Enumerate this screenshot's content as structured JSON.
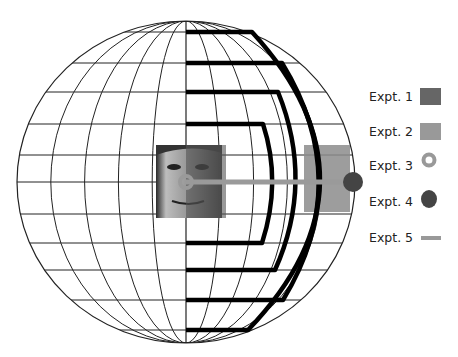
{
  "figure": {
    "globe": {
      "cx": 186,
      "cy": 182,
      "rx": 169,
      "ry": 161,
      "meridian_fractions": [
        0.2,
        0.4,
        0.6,
        0.8
      ],
      "latitudes": [
        32,
        63,
        92,
        124,
        155,
        182,
        214,
        243,
        270,
        300,
        330
      ],
      "line_color": "#222222"
    },
    "thick_paths": [
      {
        "name": "thick-path-1",
        "top_y": 124,
        "top_x": 263,
        "mid_x": 277,
        "bottom_y": 243,
        "bottom_x": 262
      },
      {
        "name": "thick-path-2",
        "top_y": 92,
        "top_x": 278,
        "mid_x": 305,
        "bottom_y": 270,
        "bottom_x": 275
      },
      {
        "name": "thick-path-3",
        "top_y": 63,
        "top_x": 282,
        "mid_x": 336,
        "bottom_y": 300,
        "bottom_x": 283
      },
      {
        "name": "thick-path-4",
        "top_y": 32,
        "top_x": 252,
        "mid_x": 354,
        "bottom_y": 330,
        "bottom_x": 248
      }
    ],
    "face": {
      "x": 156,
      "y": 145,
      "w": 66,
      "h": 73
    },
    "expt1_box": {
      "x": 186,
      "y": 145,
      "w": 40,
      "h": 73,
      "color": "#555555"
    },
    "expt2_box": {
      "x": 304,
      "y": 145,
      "w": 46,
      "h": 67,
      "color": "#8c8c8c"
    },
    "expt3_ring": {
      "cx": 186,
      "cy": 182,
      "r": 6,
      "color": "#9a9a9a"
    },
    "expt4_dot": {
      "cx": 353,
      "cy": 182,
      "r": 10,
      "color": "#444444"
    },
    "expt5_bar": {
      "x1": 186,
      "x2": 350,
      "y": 182,
      "color": "#9a9a9a"
    }
  },
  "legend": {
    "items": [
      {
        "label": "Expt. 1",
        "type": "rect",
        "color": "#666666"
      },
      {
        "label": "Expt. 2",
        "type": "rect",
        "color": "#999999"
      },
      {
        "label": "Expt. 3",
        "type": "ring",
        "color": "#999999"
      },
      {
        "label": "Expt. 4",
        "type": "dot",
        "color": "#444444"
      },
      {
        "label": "Expt. 5",
        "type": "bar",
        "color": "#999999"
      }
    ]
  }
}
